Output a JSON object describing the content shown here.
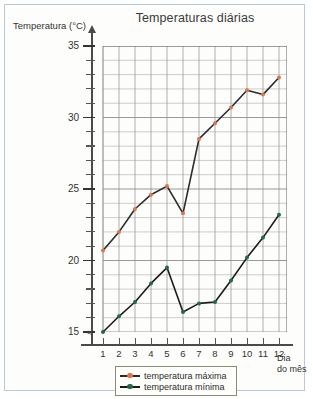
{
  "chart_data": {
    "type": "line",
    "title": "Temperaturas diárias",
    "xlabel": "Dia do mês",
    "ylabel": "Temperatura (°C)",
    "xlabel_line1": "Dia",
    "xlabel_line2": "do mês",
    "x": [
      1,
      2,
      3,
      4,
      5,
      6,
      7,
      8,
      9,
      10,
      11,
      12
    ],
    "xtick_labels": [
      "1",
      "2",
      "3",
      "4",
      "5",
      "6",
      "7",
      "8",
      "9",
      "10",
      "11",
      "12"
    ],
    "ytick_labels": [
      "15",
      "20",
      "25",
      "30",
      "35"
    ],
    "ytick_values": [
      15,
      20,
      25,
      30,
      35
    ],
    "ylim": [
      14,
      35
    ],
    "xlim": [
      0.5,
      12.5
    ],
    "grid": true,
    "legend_position": "below-chart",
    "series": [
      {
        "name": "temperatura máxima",
        "color": "#e0744a",
        "line_color": "#2a2a2a",
        "values": [
          20.7,
          22.0,
          23.6,
          24.6,
          25.2,
          23.3,
          28.5,
          29.6,
          30.7,
          31.9,
          31.6,
          32.8
        ]
      },
      {
        "name": "temperatura mínima",
        "color": "#1f6b45",
        "line_color": "#1b1b1b",
        "values": [
          15.0,
          16.1,
          17.1,
          18.4,
          19.5,
          16.4,
          17.0,
          17.1,
          18.6,
          20.2,
          21.6,
          23.2
        ]
      }
    ]
  },
  "legend": {
    "items": [
      {
        "label": "temperatura máxima",
        "color": "#e0744a"
      },
      {
        "label": "temperatura mínima",
        "color": "#1f6b45"
      }
    ]
  },
  "axis_break_symbol": "≈"
}
